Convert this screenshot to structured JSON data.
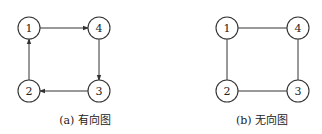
{
  "figures": [
    {
      "caption": "(a) 有向图",
      "type": "directed",
      "nodes": [
        {
          "label": "1",
          "x": 29,
          "y": 28
        },
        {
          "label": "4",
          "x": 99,
          "y": 28
        },
        {
          "label": "3",
          "x": 99,
          "y": 91
        },
        {
          "label": "2",
          "x": 29,
          "y": 91
        }
      ],
      "edges": [
        {
          "from": "1",
          "to": "4"
        },
        {
          "from": "4",
          "to": "3"
        },
        {
          "from": "3",
          "to": "2"
        },
        {
          "from": "2",
          "to": "1"
        }
      ]
    },
    {
      "caption": "(b) 无向图",
      "type": "undirected",
      "nodes": [
        {
          "label": "1",
          "x": 227,
          "y": 28
        },
        {
          "label": "4",
          "x": 298,
          "y": 28
        },
        {
          "label": "3",
          "x": 298,
          "y": 91
        },
        {
          "label": "2",
          "x": 227,
          "y": 91
        }
      ],
      "edges": [
        {
          "from": "1",
          "to": "4"
        },
        {
          "from": "4",
          "to": "3"
        },
        {
          "from": "3",
          "to": "2"
        },
        {
          "from": "2",
          "to": "1"
        }
      ]
    }
  ],
  "style": {
    "stroke": "#333333",
    "node_radius": 11
  }
}
